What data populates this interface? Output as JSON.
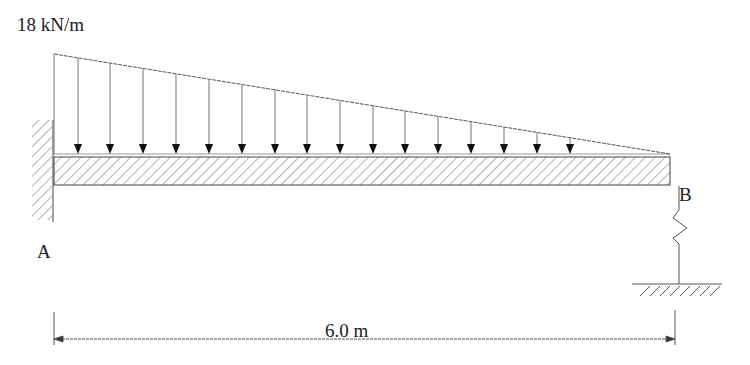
{
  "diagram": {
    "type": "cantilever beam with spring support",
    "load": {
      "label": "18 kN/m",
      "kind": "linearly varying distributed load",
      "max_at": "A",
      "min_at": "B"
    },
    "supports": {
      "A": {
        "label": "A",
        "kind": "fixed wall"
      },
      "B": {
        "label": "B",
        "kind": "spring support to ground"
      }
    },
    "dimension": {
      "label": "6.0 m"
    },
    "colors": {
      "line": "#333333",
      "hatch": "#555555",
      "arrow": "#111111"
    }
  }
}
